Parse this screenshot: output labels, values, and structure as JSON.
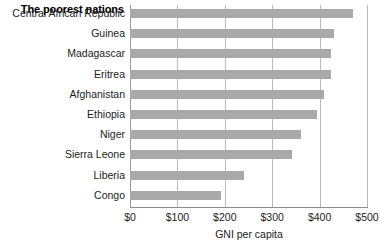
{
  "chart_data": {
    "type": "bar",
    "orientation": "horizontal",
    "title": "The poorest nations",
    "xlabel": "GNI per capita",
    "ylabel": "",
    "categories": [
      "Central African Republic",
      "Guinea",
      "Madagascar",
      "Eritrea",
      "Afghanistan",
      "Ethiopia",
      "Niger",
      "Sierra Leone",
      "Liberia",
      "Congo"
    ],
    "values": [
      470,
      430,
      425,
      425,
      410,
      395,
      360,
      342,
      240,
      192
    ],
    "xlim": [
      0,
      500
    ],
    "xticks": [
      0,
      100,
      200,
      300,
      400,
      500
    ],
    "xtick_labels": [
      "$0",
      "$100",
      "$200",
      "$300",
      "$400",
      "$500"
    ],
    "grid": true,
    "legend": false,
    "bar_color": "#a9a9a9",
    "gridline_color": "#b9b9b9",
    "background_color": "#ffffff"
  }
}
